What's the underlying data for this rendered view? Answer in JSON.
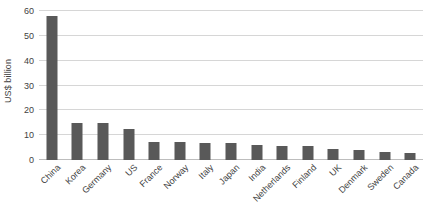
{
  "chart_data": {
    "type": "bar",
    "title": "",
    "subtitle": "",
    "xlabel": "",
    "ylabel": "US$ billion",
    "ylim": [
      0,
      60
    ],
    "ytick_labels": [
      "0",
      "10",
      "20",
      "30",
      "40",
      "50",
      "60"
    ],
    "ytick_values": [
      0,
      10,
      20,
      30,
      40,
      50,
      60
    ],
    "grid": true,
    "legend": false,
    "legend_position": "none",
    "bar_color": "#595959",
    "gridline_color": "#d6d6d6",
    "axis_text_color": "#3f3f3f",
    "categories": [
      "China",
      "Korea",
      "Germany",
      "US",
      "France",
      "Norway",
      "Italy",
      "Japan",
      "India",
      "Netherlands",
      "Finland",
      "UK",
      "Denmark",
      "Sweden",
      "Canada"
    ],
    "values": [
      58,
      14.8,
      14.8,
      12.4,
      7.3,
      7.2,
      7.0,
      6.9,
      6.0,
      5.6,
      5.5,
      4.6,
      3.9,
      3.4,
      2.9
    ],
    "series": [
      {
        "name": "US$ billion",
        "values": [
          58,
          14.8,
          14.8,
          12.4,
          7.3,
          7.2,
          7.0,
          6.9,
          6.0,
          5.6,
          5.5,
          4.6,
          3.9,
          3.4,
          2.9
        ]
      }
    ]
  }
}
